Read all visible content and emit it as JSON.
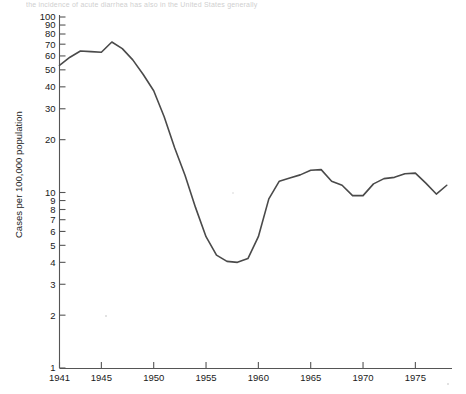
{
  "figure": {
    "top_caption": "the incidence of acute diarrhea has also in the United States generally",
    "width": 466,
    "height": 394,
    "background_color": "#ffffff",
    "line_color": "#4a4a4a",
    "axis_color": "#555555"
  },
  "chart_data": {
    "type": "line",
    "title": "",
    "subtitle": "",
    "xlabel": "",
    "ylabel": "Cases per 100,000 population",
    "yscale": "log",
    "xscale": "linear",
    "xlim": [
      1941,
      1978.5
    ],
    "ylim": [
      1,
      100
    ],
    "grid": false,
    "legend": null,
    "legend_position": "none",
    "y_tick_labels": [
      "100",
      "90",
      "80",
      "70",
      "60",
      "50",
      "40",
      "30",
      "20",
      "10",
      "9",
      "8",
      "7",
      "6",
      "5",
      "4",
      "3",
      "2",
      "1"
    ],
    "y_tick_values": [
      100,
      90,
      80,
      70,
      60,
      50,
      40,
      30,
      20,
      10,
      9,
      8,
      7,
      6,
      5,
      4,
      3,
      2,
      1
    ],
    "x_tick_labels": [
      "1941",
      "1945",
      "1950",
      "1955",
      "1960",
      "1965",
      "1970",
      "1975"
    ],
    "x_tick_values": [
      1941,
      1945,
      1950,
      1955,
      1960,
      1965,
      1970,
      1975
    ],
    "x": [
      1941,
      1942,
      1943,
      1944,
      1945,
      1946,
      1947,
      1948,
      1949,
      1950,
      1951,
      1952,
      1953,
      1954,
      1955,
      1956,
      1957,
      1958,
      1959,
      1960,
      1961,
      1962,
      1963,
      1964,
      1965,
      1966,
      1967,
      1968,
      1969,
      1970,
      1971,
      1972,
      1973,
      1974,
      1975,
      1976,
      1977,
      1978
    ],
    "values": [
      53,
      59,
      64,
      63.5,
      63,
      72,
      66,
      57,
      47,
      38,
      27,
      18,
      12.5,
      8.2,
      5.6,
      4.4,
      4.05,
      4.0,
      4.2,
      5.6,
      9.2,
      11.6,
      12.1,
      12.6,
      13.4,
      13.5,
      11.6,
      11.0,
      9.6,
      9.6,
      11.2,
      12.0,
      12.2,
      12.8,
      12.9,
      11.3,
      9.8,
      11.0
    ],
    "series": [
      {
        "name": "Cases per 100,000 population",
        "values": [
          53,
          59,
          64,
          63.5,
          63,
          72,
          66,
          57,
          47,
          38,
          27,
          18,
          12.5,
          8.2,
          5.6,
          4.4,
          4.05,
          4.0,
          4.2,
          5.6,
          9.2,
          11.6,
          12.1,
          12.6,
          13.4,
          13.5,
          11.6,
          11.0,
          9.6,
          9.6,
          11.2,
          12.0,
          12.2,
          12.8,
          12.9,
          11.3,
          9.8,
          11.0
        ]
      }
    ]
  }
}
